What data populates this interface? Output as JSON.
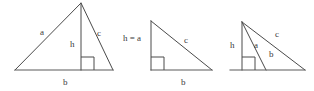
{
  "figure": {
    "background_color": "#ffffff",
    "line_color": "#4a4a4a",
    "text_color": "#3a3a3a",
    "width": 314,
    "height": 91
  },
  "diagrams": [
    {
      "id": "acute-triangle",
      "name": "acute-triangle-with-interior-altitude",
      "labels": {
        "side_a": "a",
        "height_h": "h",
        "side_c": "c",
        "base_b": "b"
      },
      "geometry": {
        "left_vertex": [
          15,
          70
        ],
        "right_vertex": [
          113,
          70
        ],
        "apex": [
          81,
          3
        ],
        "foot_of_altitude": [
          81,
          70
        ],
        "right_angle_marker": [
          81,
          57,
          13,
          13
        ]
      },
      "label_positions": {
        "side_a": [
          40,
          28
        ],
        "height_h": [
          70,
          40
        ],
        "side_c": [
          97,
          29
        ],
        "base_b": [
          63,
          78
        ]
      }
    },
    {
      "id": "right-triangle",
      "name": "right-triangle-altitude-equals-leg",
      "labels": {
        "height_equals_a": "h = a",
        "side_c": "c",
        "base_b": "b"
      },
      "geometry": {
        "apex": [
          151,
          21
        ],
        "right_angle_vertex": [
          151,
          70
        ],
        "right_vertex": [
          212,
          70
        ],
        "right_angle_marker": [
          151,
          57,
          13,
          13
        ]
      },
      "label_positions": {
        "height_equals_a": [
          123,
          34
        ],
        "side_c": [
          184,
          36
        ],
        "base_b": [
          181,
          78
        ]
      }
    },
    {
      "id": "obtuse-triangle",
      "name": "obtuse-triangle-with-exterior-construction",
      "labels": {
        "height_h": "h",
        "side_a": "a",
        "side_c": "c",
        "base_b": "b"
      },
      "geometry": {
        "apex": [
          242,
          22
        ],
        "base_left": [
          230,
          70
        ],
        "base_right": [
          305,
          70
        ],
        "foot_of_altitude": [
          242,
          70
        ],
        "segment_a_end": [
          266,
          70
        ],
        "right_angle_marker": [
          242,
          57,
          13,
          13
        ]
      },
      "label_positions": {
        "height_h": [
          230,
          41
        ],
        "side_a": [
          254,
          41
        ],
        "side_c": [
          275,
          30
        ],
        "base_b": [
          269,
          50
        ]
      }
    }
  ]
}
